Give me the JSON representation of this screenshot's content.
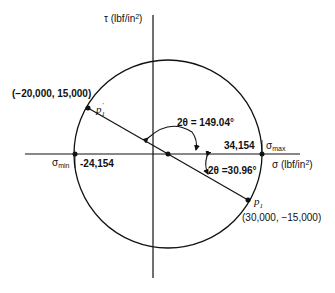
{
  "diagram": {
    "type": "mohr-circle",
    "axes": {
      "tau_label": "τ (lbf/in²)",
      "tau_symbol": "τ",
      "tau_unit": "(lbf/in",
      "tau_unit_sup": "2",
      "tau_unit_close": ")",
      "sigma_symbol": "σ",
      "sigma_unit": "(lbf/in",
      "sigma_unit_sup": "2",
      "sigma_unit_close": ")"
    },
    "points": {
      "p1_prime": {
        "label": "p",
        "sub": "1",
        "sup": "'",
        "coords": "(−20,000, 15,000)"
      },
      "p1": {
        "label": "p",
        "sub": "1",
        "coords": "(30,000, −15,000)"
      }
    },
    "principal": {
      "sigma_max_symbol": "σ",
      "sigma_max_sub": "max",
      "sigma_max_value": "34,154",
      "sigma_min_symbol": "σ",
      "sigma_min_sub": "min",
      "sigma_min_value": "-24,154"
    },
    "angles": {
      "large": "2θ = 149.04°",
      "small": "2θ =30.96°"
    },
    "colors": {
      "line": "#111111",
      "background": "#ffffff"
    }
  }
}
